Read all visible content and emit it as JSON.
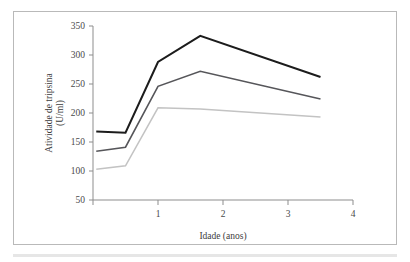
{
  "figure": {
    "frame_border_color": "#b9b9b9",
    "background_color": "#ffffff"
  },
  "chart_data": {
    "type": "line",
    "title": "",
    "subtitle": "",
    "xlabel": "Idade (anos)",
    "ylabel_line1": "Atividade de tripsina",
    "ylabel_line2": "(U/ml)",
    "ylabel": "Atividade de tripsina (U/ml)",
    "xlim": [
      0,
      4
    ],
    "ylim": [
      50,
      350
    ],
    "xticks": [
      0,
      1,
      2,
      3,
      4
    ],
    "xtick_labels": [
      "",
      "1",
      "2",
      "3",
      "4"
    ],
    "yticks": [
      50,
      100,
      150,
      200,
      250,
      300,
      350
    ],
    "ytick_labels": [
      "50",
      "100",
      "150",
      "200",
      "250",
      "300",
      "350"
    ],
    "grid": false,
    "legend": false,
    "legend_position": "none",
    "x": [
      0.05,
      0.5,
      1.0,
      1.65,
      3.5
    ],
    "series": [
      {
        "name": "serie-superior",
        "color": "#1c1c1c",
        "width": 2.0,
        "values": [
          168,
          166,
          288,
          333,
          262
        ]
      },
      {
        "name": "serie-intermediaria",
        "color": "#56565a",
        "width": 1.6,
        "values": [
          134,
          141,
          246,
          272,
          224
        ]
      },
      {
        "name": "serie-inferior",
        "color": "#c3c3c3",
        "width": 1.5,
        "values": [
          103,
          109,
          209,
          207,
          193
        ]
      }
    ]
  }
}
